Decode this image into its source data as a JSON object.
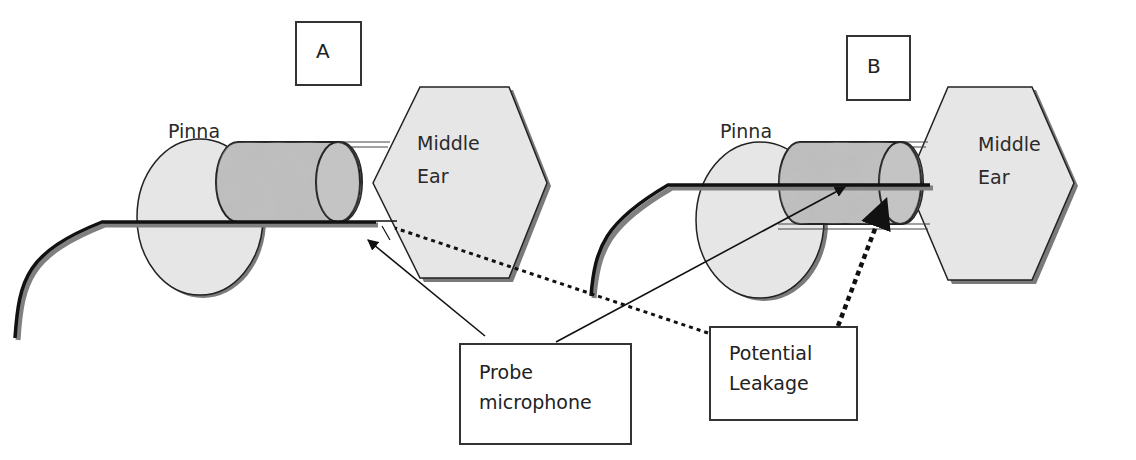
{
  "panels": [
    {
      "id": "A",
      "label": "A",
      "pinna_label": "Pinna",
      "middle_ear_label": [
        "Middle",
        "Ear"
      ]
    },
    {
      "id": "B",
      "label": "B",
      "pinna_label": "Pinna",
      "middle_ear_label": [
        "Middle",
        "Ear"
      ]
    }
  ],
  "callouts": {
    "probe_microphone": [
      "Probe",
      "microphone"
    ],
    "potential_leakage": [
      "Potential",
      "Leakage"
    ]
  },
  "colors": {
    "shape_fill": "#e6e6e6",
    "shape_stroke": "#222222",
    "shadow": "#7a7a7a",
    "plug_fill": "#b8b8b8",
    "background": "#ffffff"
  }
}
